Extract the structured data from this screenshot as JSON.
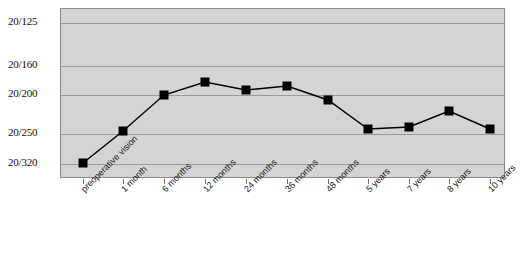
{
  "chart_data": {
    "type": "line",
    "title": "",
    "subtitle": "",
    "xlabel": "",
    "ylabel": "",
    "grid": true,
    "legend": false,
    "legend_position": "none",
    "categories": [
      "preoperative vision",
      "1 month",
      "6 months",
      "12 months",
      "24 months",
      "36 months",
      "48 months",
      "5 years",
      "7 years",
      "8 years",
      "10 years"
    ],
    "ytick_labels": [
      "20/125",
      "20/160",
      "20/200",
      "20/250",
      "20/320"
    ],
    "ytick_values": [
      125,
      160,
      200,
      250,
      320
    ],
    "ylim": [
      "20/320",
      "20/125"
    ],
    "y_axis_note": "Snellen visual acuity, better acuity upward",
    "series": [
      {
        "name": "mean visual acuity",
        "marker": "filled-square",
        "color": "#000000",
        "values": [
          320,
          255,
          196,
          178,
          190,
          185,
          205,
          250,
          248,
          215,
          250
        ],
        "value_labels": [
          "20/320",
          "20/255",
          "20/196",
          "20/178",
          "20/190",
          "20/185",
          "20/205",
          "20/250",
          "20/248",
          "20/215",
          "20/250"
        ]
      }
    ]
  },
  "axes": {
    "y_ticks": [
      {
        "label": "20/125",
        "y": 22
      },
      {
        "label": "20/160",
        "y": 65
      },
      {
        "label": "20/200",
        "y": 94
      },
      {
        "label": "20/250",
        "y": 133
      },
      {
        "label": "20/320",
        "y": 163
      }
    ],
    "x_ticks_count": 11
  },
  "style": {
    "plot_background": "#d4d4d4",
    "gridline_color": "#9a9a9a",
    "border_color": "#8a8a8a",
    "series_color": "#000000",
    "page_background": "#ffffff"
  },
  "points": [
    {
      "cat": "preoperative vision",
      "px": 23,
      "py": 163
    },
    {
      "cat": "1 month",
      "px": 63,
      "py": 131
    },
    {
      "cat": "6 months",
      "px": 104,
      "py": 95
    },
    {
      "cat": "12 months",
      "px": 145,
      "py": 82
    },
    {
      "cat": "24 months",
      "px": 186,
      "py": 90
    },
    {
      "cat": "36 months",
      "px": 227,
      "py": 86
    },
    {
      "cat": "48 months",
      "px": 268,
      "py": 100
    },
    {
      "cat": "5 years",
      "px": 308,
      "py": 129
    },
    {
      "cat": "7 years",
      "px": 349,
      "py": 127
    },
    {
      "cat": "8 years",
      "px": 389,
      "py": 111
    },
    {
      "cat": "10 years",
      "px": 430,
      "py": 129
    }
  ]
}
